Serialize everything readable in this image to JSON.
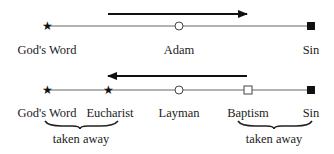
{
  "top_row": {
    "arrow_direction": "right",
    "nodes": [
      {
        "label": "God's Word",
        "marker": "filled-star"
      },
      {
        "label": "Adam",
        "marker": "open-circle"
      },
      {
        "label": "Sin",
        "marker": "filled-square"
      }
    ]
  },
  "bottom_row": {
    "arrow_direction": "left",
    "nodes": [
      {
        "label": "God's Word",
        "marker": "filled-star"
      },
      {
        "label": "Eucharist",
        "marker": "filled-star"
      },
      {
        "label": "Layman",
        "marker": "open-circle"
      },
      {
        "label": "Baptism",
        "marker": "open-square"
      },
      {
        "label": "Sin",
        "marker": "filled-square"
      }
    ],
    "braces": [
      {
        "label": "taken away",
        "spans": [
          "God's Word",
          "Eucharist"
        ]
      },
      {
        "label": "taken away",
        "spans": [
          "Baptism",
          "Sin"
        ]
      }
    ]
  },
  "colors": {
    "line": "#555555",
    "arrow": "#111111",
    "marker": "#111111"
  }
}
